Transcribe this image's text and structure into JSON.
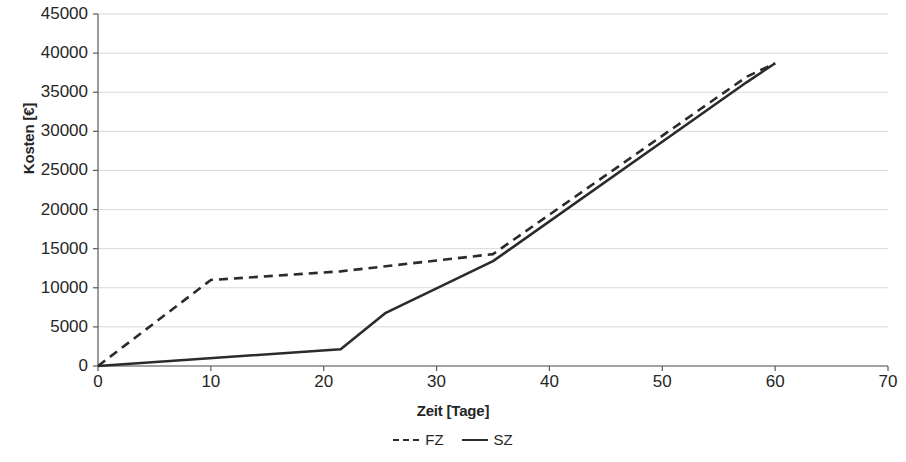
{
  "chart_data": {
    "type": "line",
    "title": "",
    "xlabel": "Zeit [Tage]",
    "ylabel": "Kosten [€]",
    "xlim": [
      0,
      70
    ],
    "ylim": [
      0,
      45000
    ],
    "xticks": [
      0,
      10,
      20,
      30,
      40,
      50,
      60,
      70
    ],
    "yticks": [
      0,
      5000,
      10000,
      15000,
      20000,
      25000,
      30000,
      35000,
      40000,
      45000
    ],
    "xtick_labels": [
      "0",
      "10",
      "20",
      "30",
      "40",
      "50",
      "60",
      "70"
    ],
    "ytick_labels": [
      "0",
      "5000",
      "10000",
      "15000",
      "20000",
      "25000",
      "30000",
      "35000",
      "40000",
      "45000"
    ],
    "grid": "horizontal",
    "legend_position": "bottom-center",
    "line_color": "#2b2b2b",
    "grid_color": "#d9d9d9",
    "axis_color": "#595959",
    "series": [
      {
        "name": "FZ",
        "style": "dashed",
        "x": [
          0,
          10,
          21.5,
          35,
          57.5,
          60
        ],
        "values": [
          0,
          11000,
          12100,
          14300,
          37000,
          38700
        ]
      },
      {
        "name": "SZ",
        "style": "solid",
        "x": [
          0,
          21.5,
          25.5,
          35,
          57.5,
          60
        ],
        "values": [
          0,
          2150,
          6800,
          13400,
          36300,
          38700
        ]
      }
    ]
  },
  "axes": {
    "y_title": "Kosten [€]",
    "x_title": "Zeit [Tage]"
  },
  "legend": {
    "items": [
      {
        "label": "FZ",
        "style": "dashed"
      },
      {
        "label": "SZ",
        "style": "solid"
      }
    ]
  }
}
